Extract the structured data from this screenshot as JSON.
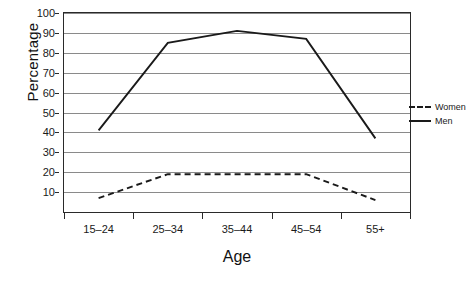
{
  "chart_data": {
    "type": "line",
    "title": "",
    "xlabel": "Age",
    "ylabel": "Percentage",
    "categories": [
      "15–24",
      "25–34",
      "35–44",
      "45–54",
      "55+"
    ],
    "series": [
      {
        "name": "Women",
        "style": "dashed",
        "color": "#1a1a1a",
        "values": [
          7,
          19,
          19,
          19,
          6
        ]
      },
      {
        "name": "Men",
        "style": "solid",
        "color": "#1a1a1a",
        "values": [
          41,
          85,
          91,
          87,
          37
        ]
      }
    ],
    "ylim": [
      0,
      100
    ],
    "ytick_values": [
      10,
      20,
      30,
      40,
      50,
      60,
      70,
      80,
      90,
      100
    ],
    "ytick_labels": [
      "10",
      "20",
      "30",
      "40",
      "50",
      "60",
      "70",
      "80",
      "90",
      "100"
    ],
    "grid": {
      "horizontal": true,
      "vertical": false,
      "color": "#8a8a8a"
    },
    "legend": {
      "position": "right",
      "entries": [
        "Women",
        "Men"
      ]
    },
    "axis_color": "#2a2a2a",
    "background": "#ffffff"
  },
  "axes": {
    "y_title": "Percentage",
    "x_title": "Age"
  },
  "legend": {
    "women_label": "Women",
    "men_label": "Men"
  }
}
